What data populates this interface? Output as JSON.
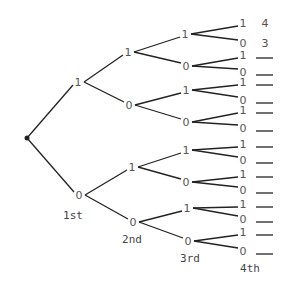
{
  "diagram": {
    "type": "binary-tree",
    "root": {
      "x": 27,
      "y": 138
    },
    "level_labels": [
      {
        "text": "1st",
        "x": 73,
        "y": 219
      },
      {
        "text": "2nd",
        "x": 132,
        "y": 243
      },
      {
        "text": "3rd",
        "x": 190,
        "y": 262
      },
      {
        "text": "4th",
        "x": 250,
        "y": 272
      }
    ],
    "levels": [
      [
        {
          "label": "1",
          "x": 78,
          "y": 82
        },
        {
          "label": "0",
          "x": 79,
          "y": 195
        }
      ],
      [
        {
          "label": "1",
          "x": 128,
          "y": 52
        },
        {
          "label": "0",
          "x": 129,
          "y": 105
        },
        {
          "label": "1",
          "x": 132,
          "y": 167
        },
        {
          "label": "0",
          "x": 133,
          "y": 222
        }
      ],
      [
        {
          "label": "1",
          "x": 185,
          "y": 34
        },
        {
          "label": "0",
          "x": 186,
          "y": 66
        },
        {
          "label": "1",
          "x": 186,
          "y": 90
        },
        {
          "label": "0",
          "x": 186,
          "y": 122
        },
        {
          "label": "1",
          "x": 186,
          "y": 150
        },
        {
          "label": "0",
          "x": 186,
          "y": 182
        },
        {
          "label": "1",
          "x": 187,
          "y": 208
        },
        {
          "label": "0",
          "x": 188,
          "y": 241
        }
      ],
      [
        {
          "label": "1",
          "x": 243,
          "y": 23
        },
        {
          "label": "0",
          "x": 243,
          "y": 43
        },
        {
          "label": "1",
          "x": 243,
          "y": 55
        },
        {
          "label": "0",
          "x": 243,
          "y": 72
        },
        {
          "label": "1",
          "x": 243,
          "y": 82
        },
        {
          "label": "0",
          "x": 243,
          "y": 100
        },
        {
          "label": "1",
          "x": 243,
          "y": 110
        },
        {
          "label": "0",
          "x": 243,
          "y": 128
        },
        {
          "label": "1",
          "x": 243,
          "y": 144
        },
        {
          "label": "0",
          "x": 243,
          "y": 160
        },
        {
          "label": "1",
          "x": 243,
          "y": 174
        },
        {
          "label": "0",
          "x": 243,
          "y": 190
        },
        {
          "label": "1",
          "x": 243,
          "y": 204
        },
        {
          "label": "0",
          "x": 243,
          "y": 219
        },
        {
          "label": "1",
          "x": 243,
          "y": 232
        },
        {
          "label": "0",
          "x": 243,
          "y": 251
        }
      ]
    ],
    "outcomes": [
      "4",
      "3",
      "",
      "",
      "",
      "",
      "",
      "",
      "",
      "",
      "",
      "",
      "",
      "",
      "",
      ""
    ],
    "colors": {
      "line": "#222222",
      "text": "#555555",
      "answer": "#5a4a4a"
    }
  }
}
